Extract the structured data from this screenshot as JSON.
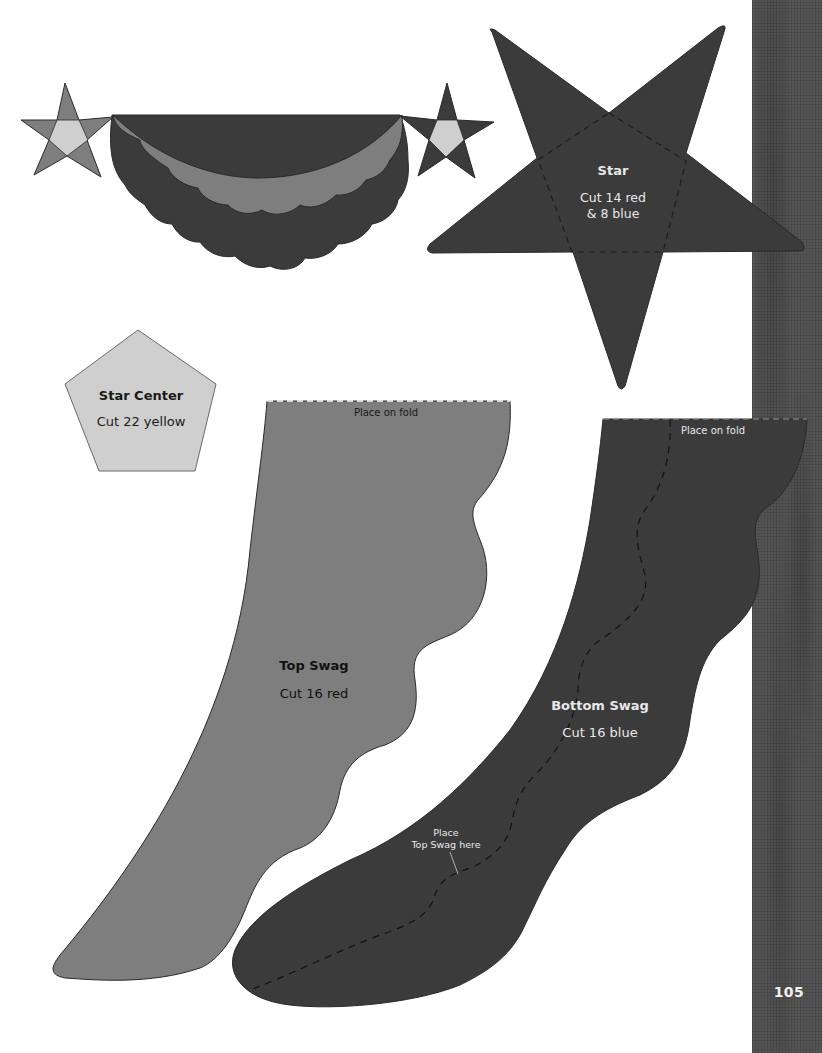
{
  "page": {
    "number": "105",
    "colors": {
      "background": "#ffffff",
      "red_fabric": "#7e7e7e",
      "blue_fabric": "#3b3b3b",
      "yellow_fabric": "#cfcfcf",
      "fabric_strip": "#555555",
      "outline": "#2a2a2a"
    }
  },
  "illustration": {
    "description": "Assembled swag with star at each end"
  },
  "templates": {
    "star": {
      "title": "Star",
      "line1": "Cut 14 red",
      "line2": "& 8 blue"
    },
    "star_center": {
      "title": "Star Center",
      "line1": "Cut 22 yellow"
    },
    "top_swag": {
      "title": "Top Swag",
      "line1": "Cut 16 red",
      "fold_label": "Place on fold"
    },
    "bottom_swag": {
      "title": "Bottom Swag",
      "line1": "Cut 16 blue",
      "fold_label": "Place on fold",
      "placement_line1": "Place",
      "placement_line2": "Top Swag here"
    }
  }
}
